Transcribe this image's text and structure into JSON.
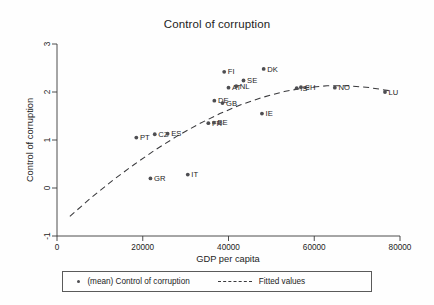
{
  "chart_data": {
    "type": "scatter",
    "title": "Control of corruption",
    "xlabel": "GDP per capita",
    "ylabel": "Control of corruption",
    "xlim": [
      0,
      80000
    ],
    "ylim": [
      -1,
      3
    ],
    "xticks": [
      "0",
      "20000",
      "40000",
      "60000",
      "80000"
    ],
    "xtick_values": [
      0,
      20000,
      40000,
      60000,
      80000
    ],
    "yticks": [
      "-1",
      "0",
      "1",
      "2",
      "3"
    ],
    "ytick_values": [
      -1,
      0,
      1,
      2,
      3
    ],
    "grid": false,
    "legend_position": "below",
    "series": [
      {
        "name": "(mean) Control of corruption",
        "marker": "circle",
        "color": "#4e4e52",
        "points": [
          {
            "label": "PT",
            "x": 18500,
            "y": 1.05
          },
          {
            "label": "GR",
            "x": 21800,
            "y": 0.2
          },
          {
            "label": "CZ",
            "x": 22800,
            "y": 1.12
          },
          {
            "label": "ES",
            "x": 25800,
            "y": 1.13
          },
          {
            "label": "IT",
            "x": 30500,
            "y": 0.28
          },
          {
            "label": "FR",
            "x": 35300,
            "y": 1.35
          },
          {
            "label": "BE",
            "x": 36600,
            "y": 1.36
          },
          {
            "label": "DE",
            "x": 36700,
            "y": 1.82
          },
          {
            "label": "GB",
            "x": 38600,
            "y": 1.77
          },
          {
            "label": "FI",
            "x": 39000,
            "y": 2.42
          },
          {
            "label": "AT",
            "x": 40000,
            "y": 2.09
          },
          {
            "label": "NL",
            "x": 41800,
            "y": 2.12
          },
          {
            "label": "SE",
            "x": 43500,
            "y": 2.24
          },
          {
            "label": "IE",
            "x": 47800,
            "y": 1.55
          },
          {
            "label": "DK",
            "x": 48200,
            "y": 2.48
          },
          {
            "label": "IS",
            "x": 55900,
            "y": 2.08
          },
          {
            "label": "CH",
            "x": 56900,
            "y": 2.1
          },
          {
            "label": "NO",
            "x": 64800,
            "y": 2.09
          },
          {
            "label": "LU",
            "x": 76500,
            "y": 2.0
          }
        ]
      },
      {
        "name": "Fitted values",
        "type": "line",
        "style": "dashed",
        "color": "#39393c",
        "points": [
          {
            "x": 3000,
            "y": -0.59
          },
          {
            "x": 8000,
            "y": -0.2
          },
          {
            "x": 13000,
            "y": 0.16
          },
          {
            "x": 18000,
            "y": 0.49
          },
          {
            "x": 23000,
            "y": 0.8
          },
          {
            "x": 28000,
            "y": 1.08
          },
          {
            "x": 33000,
            "y": 1.33
          },
          {
            "x": 38000,
            "y": 1.55
          },
          {
            "x": 43000,
            "y": 1.74
          },
          {
            "x": 48000,
            "y": 1.89
          },
          {
            "x": 53000,
            "y": 2.01
          },
          {
            "x": 58000,
            "y": 2.09
          },
          {
            "x": 63000,
            "y": 2.13
          },
          {
            "x": 68000,
            "y": 2.13
          },
          {
            "x": 73000,
            "y": 2.09
          },
          {
            "x": 78000,
            "y": 2.02
          }
        ]
      }
    ],
    "legend": [
      {
        "label": "(mean) Control of corruption",
        "marker": "circle"
      },
      {
        "label": "Fitted values",
        "marker": "dashed-line"
      }
    ]
  }
}
